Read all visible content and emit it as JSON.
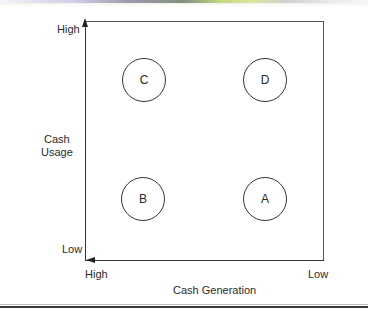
{
  "diagram": {
    "type": "2x2 matrix",
    "y_axis": {
      "title_line1": "Cash",
      "title_line2": "Usage",
      "high_label": "High",
      "low_label": "Low"
    },
    "x_axis": {
      "title": "Cash Generation",
      "high_label": "High",
      "low_label": "Low"
    },
    "quadrants": [
      {
        "id": "C",
        "label": "C",
        "position": "top-left",
        "cash_generation": "High",
        "cash_usage": "High"
      },
      {
        "id": "D",
        "label": "D",
        "position": "top-right",
        "cash_generation": "Low",
        "cash_usage": "High"
      },
      {
        "id": "B",
        "label": "B",
        "position": "bottom-left",
        "cash_generation": "High",
        "cash_usage": "Low"
      },
      {
        "id": "A",
        "label": "A",
        "position": "bottom-right",
        "cash_generation": "Low",
        "cash_usage": "Low"
      }
    ],
    "colors": {
      "line": "#333333",
      "text": "#2a2a2a",
      "background": "#ffffff"
    }
  }
}
